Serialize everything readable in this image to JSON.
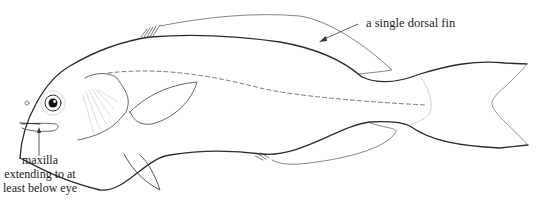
{
  "diagram": {
    "annotations": [
      {
        "id": "dorsal",
        "text": "a single dorsal fin"
      },
      {
        "id": "maxilla",
        "lines": [
          "maxilla",
          "extending to at",
          "least below eye"
        ]
      }
    ],
    "colors": {
      "outline": "#2b2b2b",
      "fin": "#777777",
      "faint": "#bbbbbb",
      "text": "#222222",
      "background": "#ffffff"
    }
  }
}
